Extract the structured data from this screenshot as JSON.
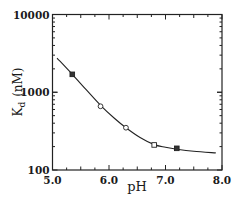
{
  "chart_data": {
    "type": "scatter",
    "title": "",
    "xlabel": "pH",
    "ylabel": "K_d (nM)",
    "ylabel_main": "K",
    "ylabel_sub": "d",
    "ylabel_unit": "(nM)",
    "xlim": [
      5.0,
      8.0
    ],
    "ylim": [
      100,
      10000
    ],
    "yscale": "log",
    "grid": false,
    "legend": null,
    "x_ticks": [
      5.0,
      6.0,
      7.0,
      8.0
    ],
    "x_tick_labels": [
      "5.0",
      "6.0",
      "7.0",
      "8.0"
    ],
    "y_ticks": [
      100,
      1000,
      10000
    ],
    "y_tick_labels": [
      "100",
      "1000",
      "10000"
    ],
    "series": [
      {
        "name": "measured",
        "kind": "points",
        "points": [
          {
            "x": 5.35,
            "y": 1700,
            "marker": "square-filled"
          },
          {
            "x": 5.85,
            "y": 660,
            "marker": "circle-open"
          },
          {
            "x": 6.3,
            "y": 350,
            "marker": "circle-open"
          },
          {
            "x": 6.8,
            "y": 210,
            "marker": "square-open"
          },
          {
            "x": 7.2,
            "y": 190,
            "marker": "square-filled"
          }
        ]
      },
      {
        "name": "fit",
        "kind": "line",
        "x": [
          5.08,
          5.35,
          5.6,
          5.85,
          6.1,
          6.3,
          6.55,
          6.8,
          7.0,
          7.2,
          7.5,
          7.89
        ],
        "y": [
          2750,
          1700,
          1070,
          680,
          460,
          350,
          262,
          212,
          196,
          185,
          174,
          166
        ]
      }
    ]
  }
}
